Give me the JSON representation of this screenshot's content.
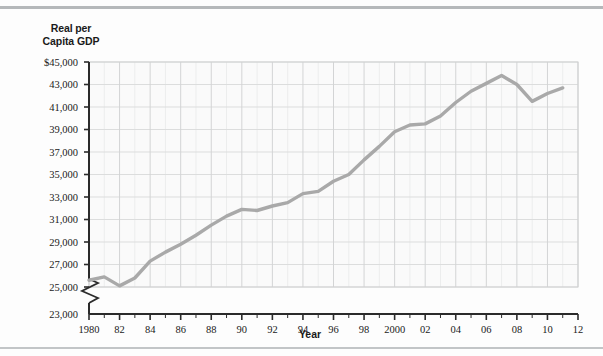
{
  "figure": {
    "background_color": "#fdfdfd",
    "rule_color": "#b5b8ba"
  },
  "axis_titles": {
    "y_line1": "Real per",
    "y_line2": "Capita GDP",
    "x": "Year"
  },
  "chart_data": {
    "type": "line",
    "title": "",
    "xlabel": "Year",
    "ylabel": "Real per Capita GDP",
    "grid": true,
    "legend": "none",
    "line_color": "#a9a9a9",
    "line_width": 3.4,
    "axis_break": true,
    "axis_break_note": "y-axis broken between 23,000 and 25,000",
    "xlim": [
      1980,
      2012
    ],
    "ylim": [
      23000,
      45000
    ],
    "y_major_step": 2000,
    "x_major_step": 2,
    "x_minor_step": 1,
    "ytick_labels": [
      "$45,000",
      "43,000",
      "41,000",
      "39,000",
      "37,000",
      "35,000",
      "33,000",
      "31,000",
      "29,000",
      "27,000",
      "25,000",
      "23,000"
    ],
    "ytick_values": [
      45000,
      43000,
      41000,
      39000,
      37000,
      35000,
      33000,
      31000,
      29000,
      27000,
      25000,
      23000
    ],
    "xtick_labels": [
      "1980",
      "82",
      "84",
      "86",
      "88",
      "90",
      "92",
      "94",
      "96",
      "98",
      "2000",
      "02",
      "04",
      "06",
      "08",
      "10",
      "12"
    ],
    "xtick_values": [
      1980,
      1982,
      1984,
      1986,
      1988,
      1990,
      1992,
      1994,
      1996,
      1998,
      2000,
      2002,
      2004,
      2006,
      2008,
      2010,
      2012
    ],
    "x": [
      1980,
      1981,
      1982,
      1983,
      1984,
      1985,
      1986,
      1987,
      1988,
      1989,
      1990,
      1991,
      1992,
      1993,
      1994,
      1995,
      1996,
      1997,
      1998,
      1999,
      2000,
      2001,
      2002,
      2003,
      2004,
      2005,
      2006,
      2007,
      2008,
      2009,
      2010,
      2011
    ],
    "values": [
      25600,
      25900,
      25100,
      25800,
      27300,
      28100,
      28800,
      29600,
      30500,
      31300,
      31900,
      31800,
      32200,
      32500,
      33300,
      33500,
      34400,
      35000,
      36300,
      37500,
      38800,
      39400,
      39500,
      40200,
      41400,
      42400,
      43100,
      43800,
      43000,
      41500,
      42200,
      42700
    ],
    "y_values_units": "constant dollars per person",
    "annotations": []
  }
}
